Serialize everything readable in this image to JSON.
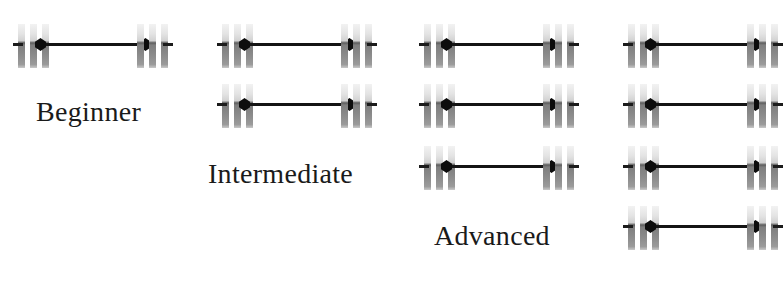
{
  "figure": {
    "title": "",
    "background_color": "#ffffff",
    "icon_name": "barbell-icon",
    "plate_color_light": "#e8e8e8",
    "plate_color_dark": "#808080",
    "bar_color": "#141414",
    "label_color": "#1a1a1a",
    "columns": [
      {
        "label": "Beginner",
        "barbell_count": 1,
        "barbells": [
          {
            "name": "barbell-beginner-1",
            "plates_per_side": 3
          }
        ]
      },
      {
        "label": "Intermediate",
        "barbell_count": 2,
        "barbells": [
          {
            "name": "barbell-intermediate-1",
            "plates_per_side": 3
          },
          {
            "name": "barbell-intermediate-2",
            "plates_per_side": 3
          }
        ]
      },
      {
        "label": "Advanced",
        "barbell_count": 3,
        "barbells": [
          {
            "name": "barbell-advanced-1",
            "plates_per_side": 3
          },
          {
            "name": "barbell-advanced-2",
            "plates_per_side": 3
          },
          {
            "name": "barbell-advanced-3",
            "plates_per_side": 3
          }
        ]
      },
      {
        "label": "",
        "barbell_count": 4,
        "barbells": [
          {
            "name": "barbell-expert-1",
            "plates_per_side": 3
          },
          {
            "name": "barbell-expert-2",
            "plates_per_side": 3
          },
          {
            "name": "barbell-expert-3",
            "plates_per_side": 3
          },
          {
            "name": "barbell-expert-4",
            "plates_per_side": 3
          }
        ]
      }
    ]
  },
  "layout": {
    "column_x": [
      18,
      222,
      424,
      628
    ],
    "row_y": [
      24,
      84,
      146,
      206
    ],
    "label_x": [
      36,
      208,
      434,
      0
    ],
    "label_y": [
      96,
      158,
      220,
      0
    ]
  }
}
